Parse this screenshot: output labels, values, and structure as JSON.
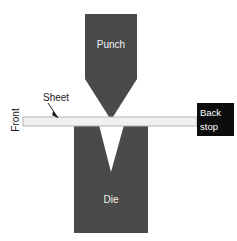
{
  "diagram": {
    "canvas": {
      "width": 237,
      "height": 241,
      "background": "#ffffff"
    },
    "colors": {
      "tooling_fill": "#4a4a4a",
      "sheet_fill": "#f0f0ee",
      "sheet_stroke": "#b4b4b2",
      "backstop_fill": "#0d0d0d",
      "backstop_text": "#ffffff",
      "tooling_text": "#f2f2f2",
      "annotation_text": "#1a1a1a",
      "leader_line": "#1a1a1a"
    },
    "parts": {
      "punch": {
        "label": "Punch",
        "label_x": 111,
        "label_y": 45,
        "points": "85,14 137,14 137,79 111,120 85,79",
        "fill": "#4a4a4a"
      },
      "die": {
        "label": "Die",
        "label_x": 111,
        "label_y": 200,
        "points": "74,125 99,125 111,172 124,125 148,125 148,233 74,233",
        "fill": "#4a4a4a"
      },
      "sheet": {
        "label": "Sheet",
        "label_x": 43,
        "label_y": 98,
        "x": 23,
        "y": 117,
        "width": 174,
        "height": 9,
        "fill": "#f0f0ee",
        "stroke": "#b4b4b2"
      },
      "backstop": {
        "label_line1": "Back",
        "label_line2": "stop",
        "x": 197,
        "y": 103,
        "width": 37,
        "height": 33,
        "fill": "#0d0d0d"
      },
      "front": {
        "label": "Front",
        "x": 16,
        "y": 120,
        "rotation": -90
      }
    },
    "leaders": {
      "sheet_arrow": {
        "x1": 48,
        "y1": 103,
        "x2": 58,
        "y2": 118,
        "head_points": "58,118 53.2,110.5 52.2,115.2"
      }
    }
  }
}
